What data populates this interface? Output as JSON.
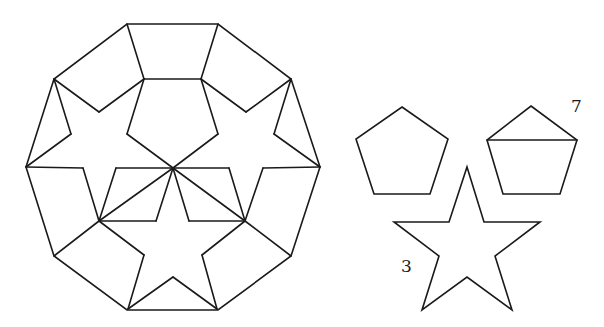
{
  "diagram": {
    "stroke_color": "#1a1a1a",
    "background": "#ffffff",
    "decagon": {
      "name": "regular-decagon-tiling",
      "outline": [
        [
          127,
          24
        ],
        [
          218,
          24
        ],
        [
          291,
          79
        ],
        [
          320,
          167
        ],
        [
          291,
          256
        ],
        [
          218,
          310
        ],
        [
          127,
          310
        ],
        [
          54,
          256
        ],
        [
          26,
          167
        ],
        [
          54,
          79
        ]
      ],
      "center": [
        173,
        168
      ],
      "segments": [
        [
          [
            144,
            79
          ],
          [
            201,
            79
          ]
        ],
        [
          [
            127,
            24
          ],
          [
            144,
            79
          ]
        ],
        [
          [
            218,
            24
          ],
          [
            201,
            79
          ]
        ],
        [
          [
            144,
            79
          ],
          [
            127,
            134
          ]
        ],
        [
          [
            201,
            79
          ],
          [
            218,
            134
          ]
        ],
        [
          [
            127,
            134
          ],
          [
            173,
            168
          ]
        ],
        [
          [
            218,
            134
          ],
          [
            173,
            168
          ]
        ],
        [
          [
            54,
            79
          ],
          [
            99,
            112
          ]
        ],
        [
          [
            99,
            112
          ],
          [
            144,
            79
          ]
        ],
        [
          [
            291,
            79
          ],
          [
            246,
            112
          ]
        ],
        [
          [
            246,
            112
          ],
          [
            201,
            79
          ]
        ],
        [
          [
            54,
            79
          ],
          [
            71,
            134
          ]
        ],
        [
          [
            71,
            134
          ],
          [
            26,
            167
          ]
        ],
        [
          [
            291,
            79
          ],
          [
            274,
            134
          ]
        ],
        [
          [
            274,
            134
          ],
          [
            320,
            167
          ]
        ],
        [
          [
            26,
            167
          ],
          [
            83,
            168
          ]
        ],
        [
          [
            83,
            168
          ],
          [
            99,
            221
          ]
        ],
        [
          [
            320,
            167
          ],
          [
            263,
            168
          ]
        ],
        [
          [
            263,
            168
          ],
          [
            245,
            221
          ]
        ],
        [
          [
            116,
            168
          ],
          [
            173,
            168
          ]
        ],
        [
          [
            116,
            168
          ],
          [
            99,
            221
          ]
        ],
        [
          [
            99,
            221
          ],
          [
            156,
            221
          ]
        ],
        [
          [
            156,
            221
          ],
          [
            173,
            168
          ]
        ],
        [
          [
            99,
            221
          ],
          [
            173,
            168
          ]
        ],
        [
          [
            173,
            168
          ],
          [
            229,
            168
          ]
        ],
        [
          [
            229,
            168
          ],
          [
            245,
            221
          ]
        ],
        [
          [
            245,
            221
          ],
          [
            189,
            221
          ]
        ],
        [
          [
            189,
            221
          ],
          [
            173,
            168
          ]
        ],
        [
          [
            173,
            168
          ],
          [
            245,
            221
          ]
        ],
        [
          [
            99,
            221
          ],
          [
            54,
            256
          ]
        ],
        [
          [
            245,
            221
          ],
          [
            291,
            256
          ]
        ],
        [
          [
            99,
            221
          ],
          [
            144,
            255
          ]
        ],
        [
          [
            144,
            255
          ],
          [
            128,
            309
          ]
        ],
        [
          [
            245,
            221
          ],
          [
            202,
            255
          ]
        ],
        [
          [
            202,
            255
          ],
          [
            217,
            309
          ]
        ],
        [
          [
            128,
            309
          ],
          [
            173,
            277
          ]
        ],
        [
          [
            173,
            277
          ],
          [
            217,
            309
          ]
        ]
      ]
    },
    "pieces": [
      {
        "name": "pentagon",
        "points": [
          [
            402,
            107
          ],
          [
            448,
            139
          ],
          [
            430,
            194
          ],
          [
            374,
            194
          ],
          [
            356,
            139
          ]
        ],
        "extra_segments": [],
        "label": ""
      },
      {
        "name": "divided-pentagon",
        "points": [
          [
            531,
            106
          ],
          [
            577,
            140
          ],
          [
            560,
            194
          ],
          [
            503,
            194
          ],
          [
            487,
            140
          ]
        ],
        "extra_segments": [
          [
            [
              487,
              140
            ],
            [
              577,
              140
            ]
          ]
        ],
        "label": "7",
        "label_pos": [
          571,
          112
        ]
      },
      {
        "name": "star",
        "points": [
          [
            467,
            167
          ],
          [
            484,
            222
          ],
          [
            540,
            222
          ],
          [
            495,
            256
          ],
          [
            512,
            310
          ],
          [
            467,
            277
          ],
          [
            422,
            310
          ],
          [
            439,
            256
          ],
          [
            394,
            222
          ],
          [
            449,
            222
          ]
        ],
        "extra_segments": [],
        "label": "3",
        "label_pos": [
          401,
          272
        ]
      }
    ]
  }
}
